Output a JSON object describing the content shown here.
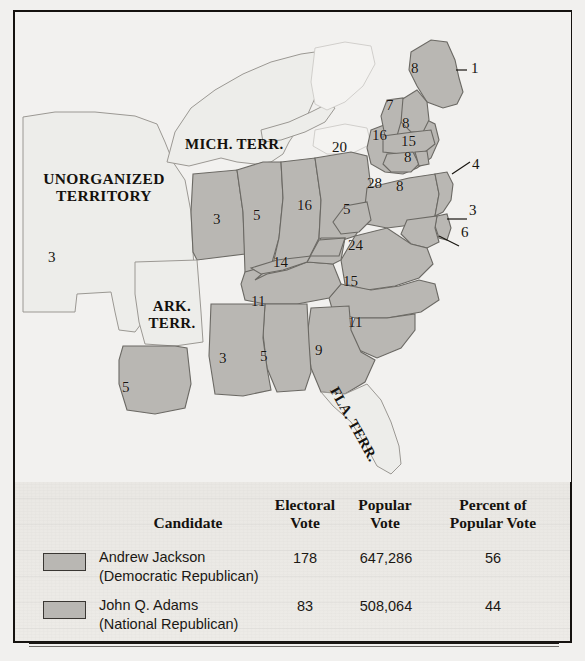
{
  "figure": {
    "kind": "historical-electoral-map",
    "colors": {
      "state_fill": "#b9b7b3",
      "state_stroke": "#6b6964",
      "territory_fill": "#ededea",
      "water": "#f2f1ef",
      "paper": "#eceae7",
      "frame": "#15120f",
      "ink": "#17140f"
    }
  },
  "map": {
    "territory_labels": [
      {
        "id": "unorganized",
        "text": "UNORGANIZED\nTERRITORY",
        "line1": "UNORGANIZED",
        "line2": "TERRITORY"
      },
      {
        "id": "michigan",
        "text": "MICH. TERR."
      },
      {
        "id": "arkansas",
        "text": "ARK.\nTERR.",
        "line1": "ARK.",
        "line2": "TERR."
      },
      {
        "id": "florida",
        "text": "FLA. TERR."
      }
    ],
    "electoral_labels": [
      {
        "id": "maine",
        "value": "8"
      },
      {
        "id": "maine-callout",
        "value": "1"
      },
      {
        "id": "new-hampshire",
        "value": "7"
      },
      {
        "id": "massachusetts",
        "value": "8"
      },
      {
        "id": "new-york",
        "value": "16"
      },
      {
        "id": "connecticut",
        "value": "15"
      },
      {
        "id": "rhode-island",
        "value": "8"
      },
      {
        "id": "new-jersey",
        "value": "4"
      },
      {
        "id": "ohio",
        "value": "20"
      },
      {
        "id": "pennsylvania",
        "value": "28"
      },
      {
        "id": "delaware",
        "value": "3"
      },
      {
        "id": "maryland",
        "value": "6"
      },
      {
        "id": "virginia-n",
        "value": "8"
      },
      {
        "id": "virginia-w",
        "value": "5"
      },
      {
        "id": "virginia",
        "value": "24"
      },
      {
        "id": "north-carolina",
        "value": "15"
      },
      {
        "id": "south-carolina",
        "value": "11"
      },
      {
        "id": "georgia",
        "value": "9"
      },
      {
        "id": "alabama",
        "value": "5"
      },
      {
        "id": "mississippi",
        "value": "3"
      },
      {
        "id": "louisiana",
        "value": "5"
      },
      {
        "id": "tennessee",
        "value": "11"
      },
      {
        "id": "kentucky",
        "value": "14"
      },
      {
        "id": "indiana",
        "value": "5"
      },
      {
        "id": "illinois",
        "value": "3"
      },
      {
        "id": "missouri",
        "value": "3"
      },
      {
        "id": "michigan-ev",
        "value": "16"
      }
    ]
  },
  "table": {
    "headers": {
      "candidate": "Candidate",
      "electoral_line1": "Electoral",
      "electoral_line2": "Vote",
      "popular_line1": "Popular",
      "popular_line2": "Vote",
      "percent_line1": "Percent of",
      "percent_line2": "Popular Vote"
    },
    "rows": [
      {
        "name": "Andrew Jackson",
        "party": "(Democratic Republican)",
        "electoral_vote": "178",
        "popular_vote": "647,286",
        "percent": "56",
        "swatch_color": "#b9b7b3"
      },
      {
        "name": "John Q. Adams",
        "party": "(National Republican)",
        "electoral_vote": "83",
        "popular_vote": "508,064",
        "percent": "44",
        "swatch_color": "#b9b7b3"
      }
    ]
  }
}
